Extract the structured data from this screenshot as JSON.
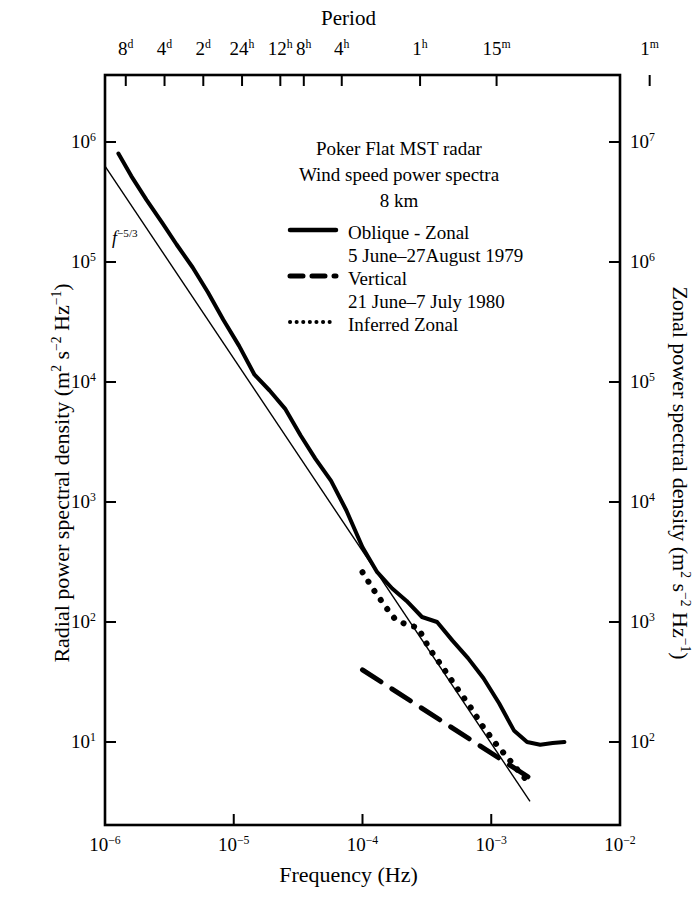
{
  "chart_data": {
    "type": "line",
    "xlabel": "Frequency (Hz)",
    "ylabel": "Radial power spectral density (m² s⁻² Hz⁻¹)",
    "y2label": "Zonal power spectral density (m² s⁻² Hz⁻¹)",
    "xscale": "log",
    "yscale": "log",
    "xlim": [
      1e-06,
      0.01
    ],
    "ylim": [
      3.0,
      2000000.0
    ],
    "y2lim": [
      30.0,
      20000000.0
    ],
    "grid": false,
    "legend_position": "upper-center",
    "top_axis_label": "Period",
    "top_ticks": [
      {
        "label": "8",
        "unit": "d",
        "freq": 1.45e-06
      },
      {
        "label": "4",
        "unit": "d",
        "freq": 2.9e-06
      },
      {
        "label": "2",
        "unit": "d",
        "freq": 5.8e-06
      },
      {
        "label": "24",
        "unit": "h",
        "freq": 1.16e-05
      },
      {
        "label": "12",
        "unit": "h",
        "freq": 2.3e-05
      },
      {
        "label": "8",
        "unit": "h",
        "freq": 3.5e-05
      },
      {
        "label": "4",
        "unit": "h",
        "freq": 6.9e-05
      },
      {
        "label": "1",
        "unit": "h",
        "freq": 0.00028
      },
      {
        "label": "15",
        "unit": "m",
        "freq": 0.0011
      },
      {
        "label": "1",
        "unit": "m",
        "freq": 0.017
      }
    ],
    "bottom_ticks": [
      "10⁻⁶",
      "10⁻⁵",
      "10⁻⁴",
      "10⁻³",
      "10⁻²"
    ],
    "bottom_tick_exponents": [
      -6,
      -5,
      -4,
      -3,
      -2
    ],
    "left_ticks": [
      "10⁶",
      "10⁵",
      "10⁴",
      "10³",
      "10²",
      "10¹"
    ],
    "left_tick_exponents": [
      6,
      5,
      4,
      3,
      2,
      1
    ],
    "right_ticks": [
      "10⁷",
      "10⁶",
      "10⁵",
      "10⁴",
      "10³",
      "10²"
    ],
    "right_tick_exponents": [
      7,
      6,
      5,
      4,
      3,
      2
    ],
    "reference_line": {
      "label": "f⁻⁵ᐟ³",
      "slope": -1.6667,
      "points": [
        [
          1e-06,
          630000.0
        ],
        [
          0.002,
          3.2
        ]
      ]
    },
    "series": [
      {
        "name": "Oblique - Zonal",
        "style": "solid",
        "linewidth": 4,
        "points": [
          [
            1.27e-06,
            800000.0
          ],
          [
            1.6e-06,
            520000.0
          ],
          [
            2.1e-06,
            330000.0
          ],
          [
            2.8e-06,
            210000.0
          ],
          [
            3.6e-06,
            140000.0
          ],
          [
            4.8e-06,
            90000.0
          ],
          [
            6.3e-06,
            56000.0
          ],
          [
            8.3e-06,
            33000.0
          ],
          [
            1.1e-05,
            20000.0
          ],
          [
            1.45e-05,
            11500.0
          ],
          [
            1.9e-05,
            8500.0
          ],
          [
            2.5e-05,
            6000.0
          ],
          [
            3.3e-05,
            3600.0
          ],
          [
            4.3e-05,
            2300.0
          ],
          [
            5.7e-05,
            1500.0
          ],
          [
            7.5e-05,
            850.0
          ],
          [
            0.0001,
            420.0
          ],
          [
            0.00013,
            260.0
          ],
          [
            0.00017,
            190.0
          ],
          [
            0.00022,
            150.0
          ],
          [
            0.00029,
            110.0
          ],
          [
            0.00038,
            100.0
          ],
          [
            0.0005,
            70.0
          ],
          [
            0.00066,
            50.0
          ],
          [
            0.00087,
            34.0
          ],
          [
            0.00115,
            21.0
          ],
          [
            0.0015,
            12.5
          ],
          [
            0.0019,
            10.0
          ],
          [
            0.0024,
            9.5
          ],
          [
            0.003,
            9.8
          ],
          [
            0.0037,
            10.0
          ]
        ]
      },
      {
        "name": "Vertical",
        "style": "dashed",
        "linewidth": 5,
        "points": [
          [
            0.0001,
            40.0
          ],
          [
            0.002,
            5.0
          ]
        ]
      },
      {
        "name": "Inferred Zonal",
        "style": "dotted",
        "linewidth": 4,
        "points": [
          [
            0.0001,
            260.0
          ],
          [
            0.00012,
            190.0
          ],
          [
            0.00015,
            135.0
          ],
          [
            0.00018,
            105.0
          ],
          [
            0.00022,
            95.0
          ],
          [
            0.00027,
            90.0
          ],
          [
            0.00033,
            60.0
          ],
          [
            0.00042,
            42.0
          ],
          [
            0.00053,
            29.0
          ],
          [
            0.00068,
            20.0
          ],
          [
            0.00086,
            13.5
          ],
          [
            0.0011,
            9.5
          ],
          [
            0.0014,
            7.0
          ],
          [
            0.00175,
            5.2
          ],
          [
            0.002,
            4.6
          ]
        ]
      }
    ],
    "annotations": [
      "Poker Flat MST radar",
      "Wind speed power spectra",
      "8 km"
    ],
    "legend_entries": [
      {
        "style": "solid",
        "label": "Oblique - Zonal",
        "sublabel": "5 June–27August 1979"
      },
      {
        "style": "dashed",
        "label": "Vertical",
        "sublabel": "21 June–7 July 1980"
      },
      {
        "style": "dotted",
        "label": "Inferred Zonal",
        "sublabel": ""
      }
    ]
  },
  "colors": {
    "ink": "#000000",
    "paper": "#ffffff"
  }
}
